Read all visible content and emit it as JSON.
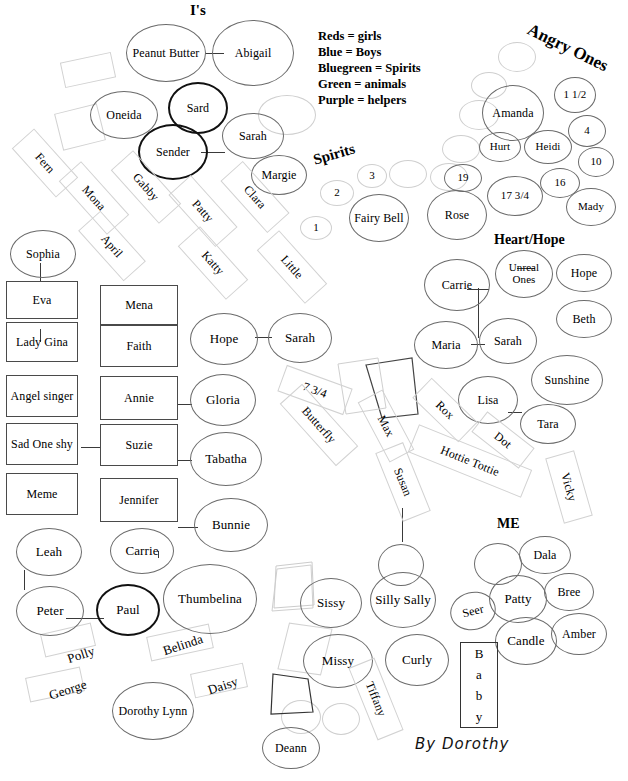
{
  "title": "I's",
  "legend": {
    "lines": [
      "Reds = girls",
      "Blue = Boys",
      "Bluegreen = Spirits",
      "Green = animals",
      "Purple = helpers"
    ]
  },
  "headings": {
    "is": "I's",
    "angry_ones": "Angry Ones",
    "spirits": "Spirits",
    "heart_hope": "Heart/Hope",
    "me": "ME"
  },
  "signature": "By Dorothy",
  "baby_box": {
    "letters": [
      "B",
      "a",
      "b",
      "y"
    ]
  },
  "groups": {
    "is_cluster": [
      {
        "label": "Peanut Butter"
      },
      {
        "label": "Abigail"
      },
      {
        "label": "Oneida"
      },
      {
        "label": "Sard"
      },
      {
        "label": "Sarah"
      },
      {
        "label": "Sender"
      },
      {
        "label": "Margie"
      },
      {
        "label": ""
      }
    ],
    "angry_ones": [
      {
        "label": "Amanda"
      },
      {
        "label": "1 1/2"
      },
      {
        "label": "4"
      },
      {
        "label": "Hurt"
      },
      {
        "label": "Heidi"
      },
      {
        "label": "10"
      },
      {
        "label": "16"
      },
      {
        "label": "17 3/4"
      },
      {
        "label": "Mady"
      },
      {
        "label": ""
      },
      {
        "label": ""
      },
      {
        "label": ""
      },
      {
        "label": ""
      }
    ],
    "spirits": [
      {
        "label": "1"
      },
      {
        "label": "2"
      },
      {
        "label": "3"
      },
      {
        "label": "Fairy Bell"
      },
      {
        "label": "19"
      },
      {
        "label": "Rose"
      },
      {
        "label": ""
      }
    ],
    "heart_hope": [
      {
        "label": "Carrie"
      },
      {
        "label": "Unreal Ones"
      },
      {
        "label": "Hope"
      },
      {
        "label": "Beth"
      },
      {
        "label": "Maria"
      },
      {
        "label": "Sarah"
      },
      {
        "label": "Sunshine"
      },
      {
        "label": "Lisa"
      },
      {
        "label": "Tara"
      }
    ],
    "me_cluster": [
      {
        "label": "Dala"
      },
      {
        "label": "Bree"
      },
      {
        "label": "Patty"
      },
      {
        "label": "Seer"
      },
      {
        "label": "Candle"
      },
      {
        "label": "Amber"
      },
      {
        "label": ""
      }
    ],
    "left_rect_column_a": [
      {
        "label": "Eva"
      },
      {
        "label": "Lady Gina"
      },
      {
        "label": "Angel singer"
      },
      {
        "label": "Sad One shy"
      },
      {
        "label": "Meme"
      }
    ],
    "left_rect_column_b": [
      {
        "label": "Mena"
      },
      {
        "label": "Faith"
      },
      {
        "label": "Annie"
      },
      {
        "label": "Suzie"
      },
      {
        "label": "Jennifer"
      }
    ],
    "center_ellipses": [
      {
        "label": "Sophia"
      },
      {
        "label": "Hope"
      },
      {
        "label": "Sarah"
      },
      {
        "label": "Gloria"
      },
      {
        "label": "Tabatha"
      },
      {
        "label": "Bunnie"
      }
    ],
    "bottom_left": [
      {
        "label": "Leah"
      },
      {
        "label": "Carrie"
      },
      {
        "label": "Peter"
      },
      {
        "label": "Paul"
      },
      {
        "label": "Thumbelina"
      },
      {
        "label": "Dorothy Lynn"
      }
    ],
    "bottom_center": [
      {
        "label": "Sissy"
      },
      {
        "label": "Silly Sally"
      },
      {
        "label": "Missy"
      },
      {
        "label": "Curly"
      },
      {
        "label": "Deann"
      },
      {
        "label": ""
      },
      {
        "label": ""
      }
    ],
    "rotated_rects": [
      {
        "label": "Fern"
      },
      {
        "label": "Mona"
      },
      {
        "label": "Gabby"
      },
      {
        "label": "April"
      },
      {
        "label": "Patty"
      },
      {
        "label": "Clara"
      },
      {
        "label": "Katty"
      },
      {
        "label": "Little"
      },
      {
        "label": "7 3/4"
      },
      {
        "label": "Butterfly"
      },
      {
        "label": "Max"
      },
      {
        "label": "Rox"
      },
      {
        "label": "Dot"
      },
      {
        "label": "Susan"
      },
      {
        "label": "Hottie Tottie"
      },
      {
        "label": "Vicky"
      },
      {
        "label": "Tiffany"
      },
      {
        "label": "Polly"
      },
      {
        "label": "Belinda"
      },
      {
        "label": "George"
      },
      {
        "label": "Daisy"
      },
      {
        "label": ""
      },
      {
        "label": ""
      },
      {
        "label": ""
      },
      {
        "label": ""
      },
      {
        "label": ""
      }
    ]
  }
}
